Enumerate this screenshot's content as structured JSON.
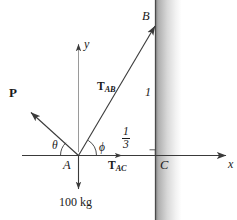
{
  "figure": {
    "type": "free-body-diagram",
    "background_color": "#ffffff",
    "line_color": "#3a3a3a",
    "text_color": "#1a1a1a",
    "wall": {
      "label": "wall",
      "gradient_from": "#8f8f8f",
      "gradient_to": "#ffffff"
    },
    "axes": {
      "x_label": "x",
      "y_label": "y"
    },
    "points": {
      "A": "A",
      "B": "B",
      "C": "C"
    },
    "forces": {
      "P": "P",
      "T_AB_main": "T",
      "T_AB_sub": "AB",
      "T_AC_main": "T",
      "T_AC_sub": "AC",
      "weight": "100 kg"
    },
    "angles": {
      "theta": "θ",
      "phi": "ϕ"
    },
    "dimensions": {
      "vertical_length": "1",
      "horizontal_numerator": "1",
      "horizontal_denominator": "3"
    },
    "marks": {
      "right_angle": "right-angle-mark"
    }
  }
}
